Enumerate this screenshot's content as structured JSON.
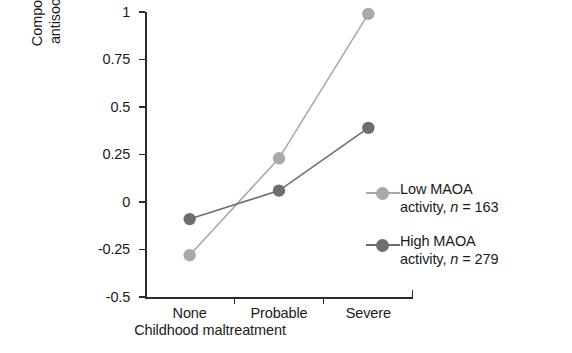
{
  "chart_data": {
    "type": "line",
    "title": "",
    "subtitle": "",
    "xlabel": "Childhood maltreatment",
    "ylabel": "Composite index of antisocial behavior",
    "ylabel_lines": [
      "Composite index of",
      "antisocial behavior"
    ],
    "categories": [
      "None",
      "Probable",
      "Severe"
    ],
    "ylim": [
      -0.5,
      1
    ],
    "yticks": [
      1,
      0.75,
      0.5,
      0.25,
      0,
      -0.25,
      -0.5
    ],
    "ytick_labels": [
      "1",
      "0.75",
      "0.5",
      "0.25",
      "0",
      "-0.25",
      "-0.5"
    ],
    "grid": false,
    "legend_position": "right",
    "series": [
      {
        "name": "Low MAOA activity",
        "legend_line1": "Low MAOA",
        "legend_line2_prefix": "activity, ",
        "legend_line2_italic": "n",
        "legend_line2_suffix": " = 163",
        "n": 163,
        "color": "#a9a9a9",
        "values": [
          -0.28,
          0.23,
          0.99
        ]
      },
      {
        "name": "High MAOA activity",
        "legend_line1": "High MAOA",
        "legend_line2_prefix": "activity, ",
        "legend_line2_italic": "n",
        "legend_line2_suffix": " = 279",
        "n": 279,
        "color": "#6e6e6e",
        "values": [
          -0.09,
          0.06,
          0.39
        ]
      }
    ]
  },
  "axis": {
    "spine_color": "#2b2b2b"
  }
}
